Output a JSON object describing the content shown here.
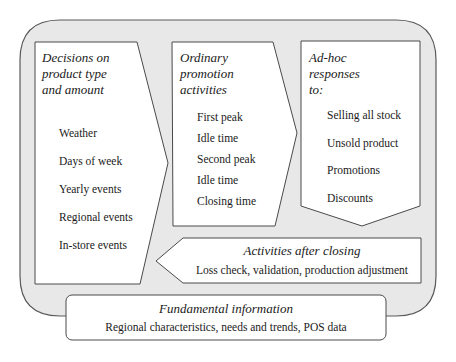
{
  "colors": {
    "container_fill": "#e8e8e8",
    "container_stroke": "#5a5a5a",
    "box_fill": "#ffffff",
    "box_stroke": "#4a4a4a",
    "text": "#1a1a1a"
  },
  "decisions": {
    "title": "Decisions on product type and amount",
    "title_lines": [
      "Decisions on",
      "product type",
      "and amount"
    ],
    "items": [
      "Weather",
      "Days of week",
      "Yearly events",
      "Regional events",
      "In-store events"
    ]
  },
  "ordinary": {
    "title": "Ordinary promotion activities",
    "title_lines": [
      "Ordinary",
      "promotion",
      "activities"
    ],
    "items": [
      "First peak",
      "Idle time",
      "Second peak",
      "Idle time",
      "Closing time"
    ]
  },
  "adhoc": {
    "title": "Ad-hoc responses to:",
    "title_lines": [
      "Ad-hoc",
      "responses",
      "to:"
    ],
    "items": [
      "Selling all stock",
      "Unsold product",
      "Promotions",
      "Discounts"
    ]
  },
  "after_closing": {
    "title": "Activities after closing",
    "description": "Loss check, validation, production adjustment"
  },
  "fundamental": {
    "title": "Fundamental information",
    "description": "Regional characteristics, needs and trends, POS data"
  }
}
